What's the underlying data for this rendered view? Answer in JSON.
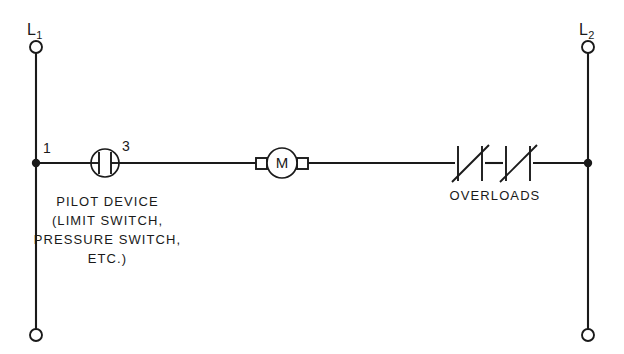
{
  "diagram": {
    "background_color": "#ffffff",
    "line_color": "#1a1a1a",
    "rails": {
      "left": {
        "label_letter": "L",
        "label_subscript": "1",
        "label_full": "L1"
      },
      "right": {
        "label_letter": "L",
        "label_subscript": "2",
        "label_full": "L2"
      }
    },
    "terminal_numbers": {
      "input": "1",
      "output": "3"
    },
    "pilot_device": {
      "symbol": "normally-open-contact-in-circle",
      "caption_lines": [
        "PILOT DEVICE",
        "(LIMIT SWITCH,",
        "PRESSURE SWITCH,",
        "ETC.)"
      ]
    },
    "motor": {
      "symbol": "motor-circle",
      "letter": "M"
    },
    "overloads": {
      "symbol": "normally-closed-overload-contact",
      "count": 2,
      "label": "OVERLOADS"
    }
  }
}
